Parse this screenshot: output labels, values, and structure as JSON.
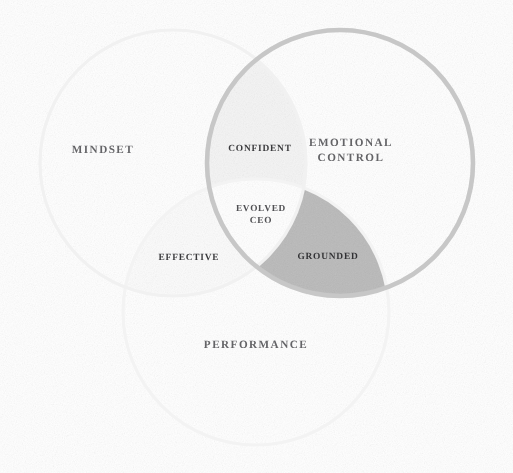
{
  "diagram": {
    "type": "venn",
    "background_color": "#ffffff",
    "sets": [
      {
        "id": "mindset",
        "label": "MINDSET",
        "position": "left",
        "center_x": 173,
        "center_y": 163,
        "radius": 133,
        "stroke_color": "#f2f2f2",
        "fill_color": "#ffffff"
      },
      {
        "id": "emotional-control",
        "label": "EMOTIONAL\nCONTROL",
        "position": "right",
        "center_x": 340,
        "center_y": 163,
        "radius": 133,
        "stroke_color": "#c9c9c9",
        "fill_color": "#ffffff"
      },
      {
        "id": "performance",
        "label": "PERFORMANCE",
        "position": "bottom",
        "center_x": 256,
        "center_y": 312,
        "radius": 133,
        "stroke_color": "#f4f4f4",
        "fill_color": "#ffffff"
      }
    ],
    "intersections": [
      {
        "id": "confident",
        "label": "CONFIDENT",
        "sets": [
          "mindset",
          "emotional-control"
        ],
        "fill_color": "#f5f5f5",
        "position": "top"
      },
      {
        "id": "effective",
        "label": "EFFECTIVE",
        "sets": [
          "mindset",
          "performance"
        ],
        "fill_color": "#fafafa",
        "position": "left"
      },
      {
        "id": "grounded",
        "label": "GROUNDED",
        "sets": [
          "emotional-control",
          "performance"
        ],
        "fill_color": "#b9b9b9",
        "position": "right",
        "highlighted": true
      },
      {
        "id": "evolved-ceo",
        "label": "EVOLVED\nCEO",
        "sets": [
          "mindset",
          "emotional-control",
          "performance"
        ],
        "fill_color": "#ffffff",
        "position": "center"
      }
    ]
  }
}
